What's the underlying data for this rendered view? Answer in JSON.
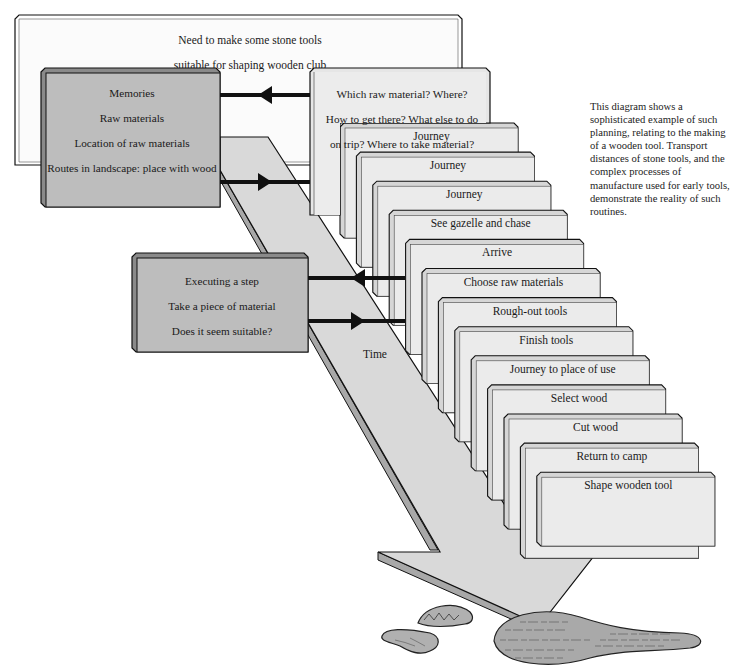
{
  "diagram": {
    "goal_box": {
      "lines": [
        "Need to make some stone tools",
        "suitable for shaping wooden club"
      ]
    },
    "memory_box": {
      "lines": [
        "Memories",
        "Raw materials",
        "Location of raw materials",
        "Routes in landscape: place with wood"
      ]
    },
    "planning_box": {
      "lines": [
        "Which raw material? Where?",
        "How to get there?  What else to do",
        "on trip? Where to take material?"
      ]
    },
    "execution_box": {
      "lines": [
        "Executing a step",
        "Take a piece of material",
        "Does it seem suitable?"
      ]
    },
    "time_arrow": {
      "label": "Time"
    },
    "steps": [
      "Journey",
      "Journey",
      "Journey",
      "See gazelle and chase",
      "Arrive",
      "Choose raw materials",
      "Rough-out tools",
      "Finish tools",
      "Journey to place of use",
      "Select wood",
      "Cut wood",
      "Return to camp",
      "Shape wooden tool"
    ],
    "connectors": [
      {
        "from": "planning_box",
        "to": "memory_box",
        "direction": "left"
      },
      {
        "from": "memory_box",
        "to": "planning_box",
        "direction": "right"
      },
      {
        "from": "steps",
        "to": "execution_box",
        "direction": "left"
      },
      {
        "from": "execution_box",
        "to": "steps",
        "direction": "right"
      }
    ],
    "illustrations": [
      "stone-tool-rough",
      "stone-flake",
      "wooden-club"
    ],
    "caption": "This diagram shows a sophisticated example of such planning, relating to the making of a wooden tool. Transport distances of stone tools, and the complex processes of manufacture used for early tools, demonstrate the reality of such routines.",
    "colors": {
      "goal_box_fill": "#fbfbfb",
      "dark_box_fill": "#bdbdbd",
      "dark_box_side": "#8a8a8a",
      "card_fill": "#ebebeb",
      "card_side": "#d6d6d6",
      "arrow_fill": "#d9d9d9",
      "arrow_shadow": "#a8a8a8",
      "stroke": "#111111"
    }
  }
}
